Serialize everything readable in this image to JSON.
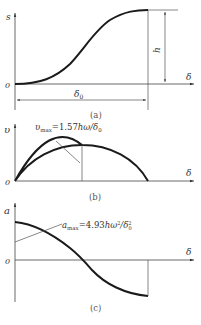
{
  "panels": {
    "a": {
      "caption": "(a)",
      "y_axis_label": "s",
      "x_axis_label": "δ",
      "origin_label": "0",
      "height_label": "h",
      "span_label": "δ0",
      "span_label_main": "δ",
      "span_label_sub": "0"
    },
    "b": {
      "caption": "(b)",
      "y_axis_label": "υ",
      "x_axis_label": "δ",
      "origin_label": "0",
      "annotation_main": "υ",
      "annotation_sub": "max",
      "annotation_rest": "=1.57hω/δ",
      "annotation_sub2": "0",
      "annotation_full": "υmax=1.57hω/δ0"
    },
    "c": {
      "caption": "(c)",
      "y_axis_label": "a",
      "x_axis_label": "δ",
      "origin_label": "0",
      "annotation_main": "a",
      "annotation_sub": "max",
      "annotation_rest": "=4.93hω",
      "annotation_sup": "2",
      "annotation_rest2": "/δ",
      "annotation_sub2": "0",
      "annotation_sup2": "2",
      "annotation_full": "amax=4.93hω²/δ0²"
    }
  },
  "colors": {
    "curve": "#1a1a1a",
    "axis": "#444444",
    "text": "#333333"
  }
}
